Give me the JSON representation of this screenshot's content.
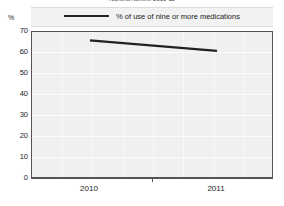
{
  "chart_data": {
    "type": "line",
    "title": "Nursing homes, 2010-11",
    "legend": [
      {
        "name": "% of use of nine or more medications",
        "color": "#222222"
      }
    ],
    "legend_position": "top-center",
    "series": [
      {
        "name": "% of use of nine or more medications",
        "values": [
          66,
          61
        ],
        "color": "#222222"
      }
    ],
    "categories": [
      "2010",
      "2011"
    ],
    "x": [
      "2010",
      "2011"
    ],
    "xlabel": "",
    "ylabel": "%",
    "yunit": "%",
    "ylim": [
      0,
      70
    ],
    "yticks": [
      0,
      10,
      20,
      30,
      40,
      50,
      60,
      70
    ],
    "ytick_labels": [
      "0",
      "10",
      "20",
      "30",
      "40",
      "50",
      "60",
      "70"
    ],
    "xtick_labels": [
      "2010",
      "2011"
    ],
    "grid": true,
    "grid_color": "#ffffff",
    "plot_background": "#f0f0f0",
    "frame_color": "#555555"
  },
  "axis": {
    "unit_label": "%"
  }
}
